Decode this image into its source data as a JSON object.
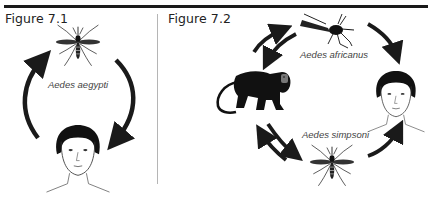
{
  "figures": [
    {
      "title": "Figure 7.1",
      "vector_label": "Aedes aegypti",
      "nodes": [
        "mosquito (Aedes aegypti)",
        "human"
      ],
      "cycle": "mosquito → human → mosquito"
    },
    {
      "title": "Figure 7.2",
      "vector_labels": {
        "top": "Aedes africanus",
        "bottom": "Aedes simpsoni"
      },
      "nodes": [
        "mosquito (Aedes africanus)",
        "monkey",
        "human",
        "mosquito (Aedes simpsoni)"
      ],
      "edges": [
        "monkey ↔ Aedes africanus",
        "Aedes africanus → human",
        "monkey ↔ Aedes simpsoni",
        "Aedes simpsoni → human"
      ]
    }
  ],
  "colors": {
    "ink": "#1a1a1a",
    "divider": "#b5b5b5",
    "label": "#444444"
  }
}
